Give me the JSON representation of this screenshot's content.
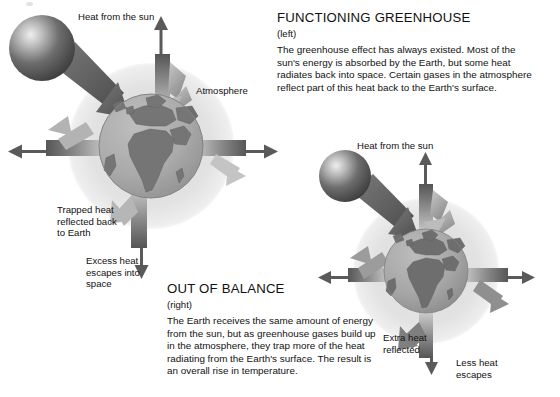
{
  "figure": {
    "title_visible": false,
    "medium": "grayscale scanned illustration"
  },
  "panels": {
    "functioning_greenhouse": {
      "heading": "FUNCTIONING GREENHOUSE",
      "subhead": "(left)",
      "body": "The greenhouse effect has always existed. Most of the sun's energy is absorbed by the Earth, but some heat radiates back into space. Certain gases in the atmosphere reflect part of this heat back to the Earth's surface."
    },
    "out_of_balance": {
      "heading": "OUT OF BALANCE",
      "subhead": "(right)",
      "body": "The Earth receives the same amount of energy from the sun, but as greenhouse gases build up in the atmosphere, they trap more of the heat radiating from the Earth's surface. The result is an overall rise in temperature."
    }
  },
  "diagram_left": {
    "name": "functioning-greenhouse-diagram",
    "labels": {
      "heat_from_sun": "Heat from the sun",
      "atmosphere": "Atmosphere",
      "trapped_heat": "Trapped heat\nreflected back\nto Earth",
      "trapped_heat_lines": [
        "Trapped heat",
        "reflected back",
        "to Earth"
      ],
      "excess_heat": "Excess heat\nescapes into\nspace",
      "excess_heat_lines": [
        "Excess heat",
        "escapes into",
        "space"
      ]
    },
    "elements": [
      "sun",
      "earth-globe",
      "atmosphere-halo",
      "incoming-solar-arrow",
      "escaping-heat-arrow",
      "reflected-heat-arrow",
      "side-arrows"
    ]
  },
  "diagram_right": {
    "name": "out-of-balance-diagram",
    "labels": {
      "heat_from_sun": "Heat from the sun",
      "extra_heat": "Extra heat\nreflected",
      "extra_heat_lines": [
        "Extra heat",
        "reflected"
      ],
      "less_heat": "Less heat\nescapes",
      "less_heat_lines": [
        "Less heat",
        "escapes"
      ]
    },
    "elements": [
      "sun",
      "earth-globe",
      "atmosphere-halo",
      "incoming-solar-arrow",
      "escaping-heat-arrow",
      "reflected-heat-arrows",
      "side-arrows"
    ]
  },
  "colors": {
    "background": "#ffffff",
    "text": "#111111",
    "atmosphere": "#e3e3e3",
    "ocean": "#a9a9a9",
    "land": "#6e6e6e",
    "sun_dark": "#4a4a4a",
    "sun_highlight": "#e8e8e8",
    "arrow_dark": "#6b6b6b",
    "arrow_light": "#cfcfcf"
  }
}
